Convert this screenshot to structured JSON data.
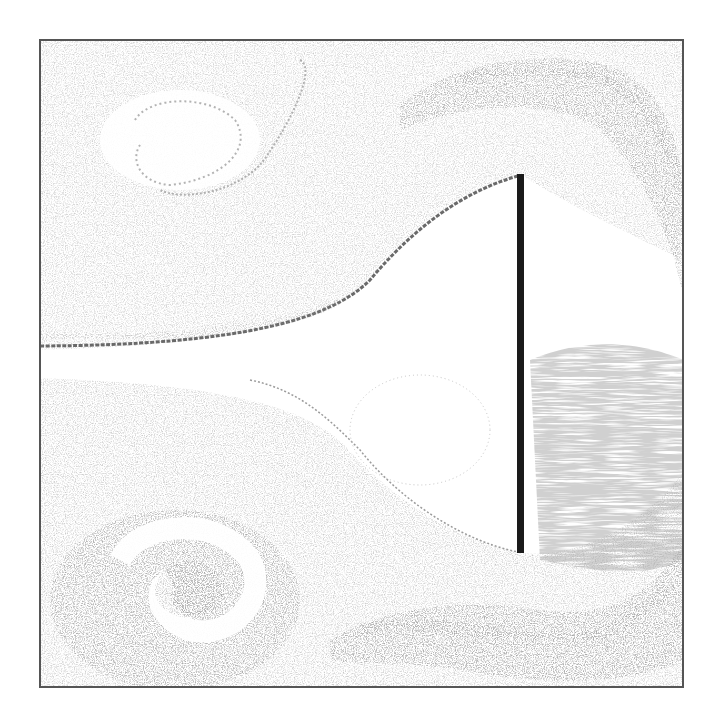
{
  "figure": {
    "colors": {
      "background": "#ffffff",
      "frame": "#555555",
      "plate": "#1a1a1a",
      "streak_dark": "#6a6a6a",
      "streak_mid": "#9a9a9a",
      "streak_light": "#c8c8c8"
    },
    "frame": {
      "x": 39,
      "y": 39,
      "width": 645,
      "height": 649
    },
    "plate": {
      "x": 517,
      "y": 174,
      "width": 7,
      "height": 379
    },
    "features": [
      {
        "name": "upper-shear-layer",
        "type": "curve"
      },
      {
        "name": "lower-shear-layer",
        "type": "curve"
      },
      {
        "name": "upper-left-vortex",
        "type": "vortex"
      },
      {
        "name": "lower-left-vortex",
        "type": "vortex"
      },
      {
        "name": "upper-right-vortex-band",
        "type": "band"
      },
      {
        "name": "lower-right-vortex-band",
        "type": "band"
      },
      {
        "name": "wake-recirculation-region",
        "type": "region"
      }
    ]
  }
}
